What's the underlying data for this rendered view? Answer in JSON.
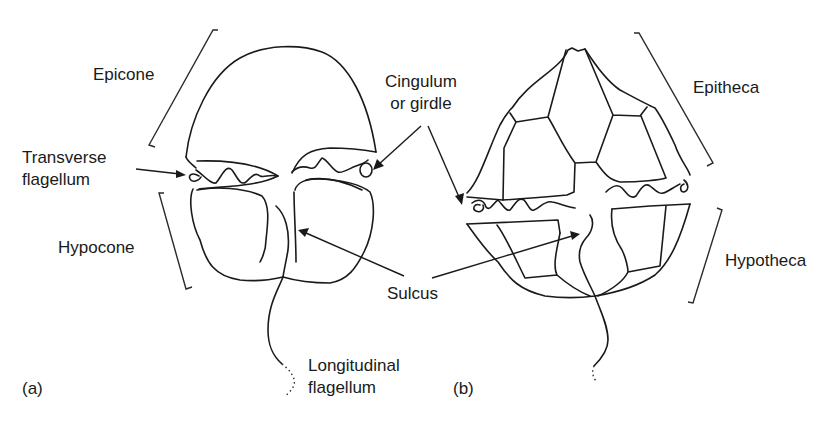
{
  "figure": {
    "panel_a": {
      "tag": "(a)",
      "labels": {
        "epicone": "Epicone",
        "transverse_flagellum_line1": "Transverse",
        "transverse_flagellum_line2": "flagellum",
        "hypocone": "Hypocone",
        "longitudinal_flagellum_line1": "Longitudinal",
        "longitudinal_flagellum_line2": "flagellum"
      }
    },
    "panel_b": {
      "tag": "(b)",
      "labels": {
        "epitheca": "Epitheca",
        "hypotheca": "Hypotheca"
      }
    },
    "shared_labels": {
      "cingulum_line1": "Cingulum",
      "cingulum_line2": "or girdle",
      "sulcus": "Sulcus"
    },
    "colors": {
      "line": "#1a1a1a",
      "background": "#ffffff"
    }
  }
}
